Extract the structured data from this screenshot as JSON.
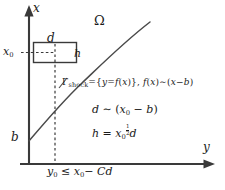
{
  "figure": {
    "type": "math-diagram",
    "background_color": "#ffffff",
    "stroke_color": "#3a3a3a",
    "text_color": "#1a1a1a"
  },
  "axes": {
    "x_axis_label": "x",
    "y_axis_label": "y",
    "x_axis_tick_label": "x0",
    "origin_label": "b"
  },
  "labels": {
    "domain": "Ω",
    "box_width": "d",
    "box_height": "h",
    "curve_start": "b"
  },
  "formulas": {
    "shock_curve": "Γshock={y=f(x)}, f(x)∼(x−b)",
    "d_relation": "d ∼ (x0 − b)",
    "h_relation": "h = x0^(1/2) d",
    "constraint": "y0 ≤ x0− Cd"
  },
  "formula_parts": {
    "shock_gamma": "Γ",
    "shock_subscript": "shock",
    "shock_body": "={y=f(x)}, f(x)∼(x−b)",
    "d_rel_lhs": "d",
    "d_rel_op": "∼",
    "d_rel_rhs": "(x0 − b)",
    "h_rel_lhs": "h",
    "h_rel_eq": "=",
    "h_exp_num": "1",
    "h_exp_den": "2",
    "constraint_lhs": "y0",
    "constraint_op": "≤",
    "constraint_rhs": "x0− Cd"
  },
  "geometry": {
    "box": {
      "x": 33,
      "y": 42,
      "width": 44,
      "height": 21
    },
    "x_axis_tick_y": 52,
    "curve_note": "concave increasing curve from (29,140) to (150,22)"
  }
}
